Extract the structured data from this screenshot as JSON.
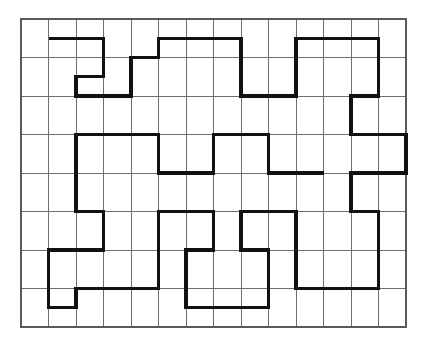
{
  "figure": {
    "kind": "line-drawing",
    "background_color": "#ffffff",
    "grid": {
      "origin_x": 21,
      "origin_y": 19,
      "cols": 14,
      "rows": 8,
      "cell_width": 27.5,
      "cell_height": 38.5,
      "line_color": "#6f6f6f",
      "line_width": 1,
      "border_color": "#5a5a5a",
      "border_width": 1.2
    },
    "curve": {
      "stroke_color": "#111111",
      "stroke_width": 3.2,
      "line_join": "miter",
      "line_cap": "butt",
      "description": "Single continuous orthogonal polyline traced along grid lines",
      "points": [
        [
          1,
          0.5
        ],
        [
          3,
          0.5
        ],
        [
          3,
          1.5
        ],
        [
          2,
          1.5
        ],
        [
          2,
          2
        ],
        [
          4,
          2
        ],
        [
          4,
          1
        ],
        [
          5,
          1
        ],
        [
          5,
          0.5
        ],
        [
          8,
          0.5
        ],
        [
          8,
          2
        ],
        [
          10,
          2
        ],
        [
          10,
          0.5
        ],
        [
          13,
          0.5
        ],
        [
          13,
          2
        ],
        [
          12,
          2
        ],
        [
          12,
          3
        ],
        [
          14,
          3
        ],
        [
          14,
          4
        ],
        [
          12,
          4
        ],
        [
          12,
          5
        ],
        [
          13,
          5
        ],
        [
          13,
          7
        ],
        [
          10,
          7
        ],
        [
          10,
          5
        ],
        [
          8,
          5
        ],
        [
          8,
          6
        ],
        [
          9,
          6
        ],
        [
          9,
          7.5
        ],
        [
          6,
          7.5
        ],
        [
          6,
          6
        ],
        [
          7,
          6
        ],
        [
          7,
          5
        ],
        [
          5,
          5
        ],
        [
          5,
          7
        ],
        [
          2,
          7
        ],
        [
          2,
          7.5
        ],
        [
          1,
          7.5
        ],
        [
          1,
          6
        ],
        [
          3,
          6
        ],
        [
          3,
          5
        ],
        [
          2,
          5
        ],
        [
          2,
          3
        ],
        [
          5,
          3
        ],
        [
          5,
          4
        ],
        [
          7,
          4
        ],
        [
          7,
          3
        ],
        [
          9,
          3
        ],
        [
          9,
          4
        ],
        [
          11,
          4
        ]
      ]
    },
    "segments": [
      {
        "name": "tl-lobe-1",
        "from": [
          1,
          0.5
        ],
        "to": [
          3,
          0.5
        ]
      },
      {
        "name": "tl-lobe-2",
        "from": [
          3,
          0.5
        ],
        "to": [
          3,
          1.5
        ]
      },
      {
        "name": "tl-lobe-3",
        "from": [
          3,
          1.5
        ],
        "to": [
          2,
          1.5
        ]
      },
      {
        "name": "tr-lobe-1",
        "from": [
          5,
          0.5
        ],
        "to": [
          8,
          0.5
        ]
      },
      {
        "name": "tr-lobe-2",
        "from": [
          10,
          0.5
        ],
        "to": [
          13,
          0.5
        ]
      },
      {
        "name": "bl-lobe-1",
        "from": [
          1,
          7.5
        ],
        "to": [
          2,
          7.5
        ]
      },
      {
        "name": "br-lobe-1",
        "from": [
          6,
          7.5
        ],
        "to": [
          9,
          7.5
        ]
      }
    ]
  }
}
